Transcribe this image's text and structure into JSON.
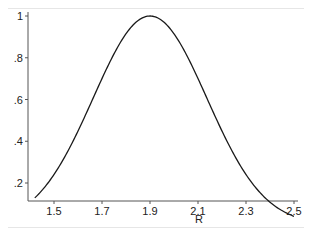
{
  "chart_data": {
    "type": "line",
    "title": "",
    "xlabel": "R",
    "ylabel": "",
    "xlim": [
      1.42,
      2.5
    ],
    "ylim": [
      0.13,
      1.0
    ],
    "x_ticks": [
      "1.5",
      "1.7",
      "1.9",
      "2.1",
      "2.3",
      "2.5"
    ],
    "y_ticks": [
      "1",
      ".8",
      ".6",
      ".4",
      ".2"
    ],
    "grid": false,
    "legend": null,
    "series": [
      {
        "name": "density",
        "x": [
          1.42,
          1.5,
          1.6,
          1.7,
          1.8,
          1.9,
          2.0,
          2.1,
          2.2,
          2.3,
          2.4,
          2.5
        ],
        "y": [
          0.15,
          0.24,
          0.45,
          0.7,
          0.91,
          1.0,
          0.91,
          0.7,
          0.45,
          0.24,
          0.11,
          0.15
        ]
      }
    ],
    "curve_model": {
      "form": "gaussian",
      "peak_x": 1.9,
      "peak_y": 1.0,
      "sigma": 0.237
    }
  },
  "colors": {
    "line": "#1a1a1a",
    "axis": "#555555",
    "frame": "#e6e6e6"
  }
}
